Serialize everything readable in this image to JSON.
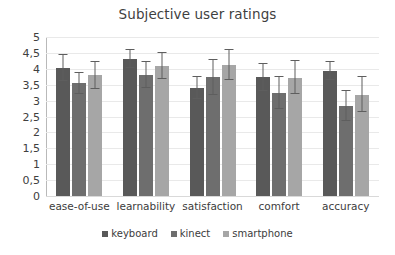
{
  "chart_data": {
    "type": "bar",
    "title": "Subjective user ratings",
    "xlabel": "",
    "ylabel": "",
    "ylim": [
      0,
      5
    ],
    "ytick_labels": [
      "0",
      "0,5",
      "1",
      "1,5",
      "2",
      "2,5",
      "3",
      "3,5",
      "4",
      "4,5",
      "5"
    ],
    "ytick_values": [
      0,
      0.5,
      1,
      1.5,
      2,
      2.5,
      3,
      3.5,
      4,
      4.5,
      5
    ],
    "grid": true,
    "legend_position": "bottom",
    "categories": [
      "ease-of-use",
      "learnability",
      "satisfaction",
      "comfort",
      "accuracy"
    ],
    "series": [
      {
        "name": "keyboard",
        "color": "#595959",
        "values": [
          4.03,
          4.32,
          3.4,
          3.73,
          3.93
        ],
        "errors": [
          0.42,
          0.28,
          0.35,
          0.42,
          0.27
        ]
      },
      {
        "name": "kinect",
        "color": "#6e6e6e",
        "values": [
          3.55,
          3.81,
          3.73,
          3.23,
          2.83
        ],
        "errors": [
          0.33,
          0.42,
          0.55,
          0.5,
          0.48
        ]
      },
      {
        "name": "smartphone",
        "color": "#a6a6a6",
        "values": [
          3.8,
          4.08,
          4.13,
          3.72,
          3.18
        ],
        "errors": [
          0.42,
          0.41,
          0.47,
          0.52,
          0.55
        ]
      }
    ]
  },
  "colors": {
    "gridline": "#e9e9e9",
    "axis": "#b9b9b9",
    "error_bar": "#5e5e5e",
    "text": "#3c3c3c",
    "background": "#ffffff"
  }
}
